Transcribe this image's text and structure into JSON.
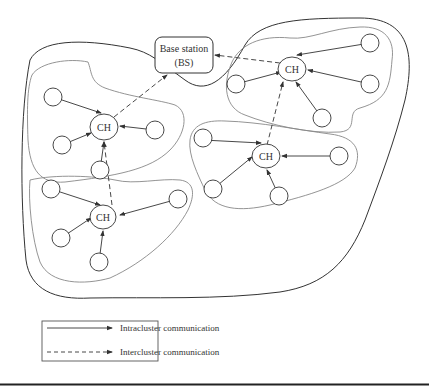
{
  "diagram": {
    "base_station": {
      "line1": "Base station",
      "line2": "(BS)"
    },
    "cluster_heads": [
      {
        "id": "ch-top-right",
        "label": "CH"
      },
      {
        "id": "ch-left",
        "label": "CH"
      },
      {
        "id": "ch-middle-right",
        "label": "CH"
      },
      {
        "id": "ch-bottom-left",
        "label": "CH"
      }
    ],
    "legend": {
      "items": [
        {
          "style": "solid",
          "label": "Intracluster communication"
        },
        {
          "style": "dashed",
          "label": "Intercluster communication"
        }
      ]
    },
    "colors": {
      "stroke": "#333333",
      "cluster_boundary": "#888888",
      "background": "#ffffff"
    }
  }
}
